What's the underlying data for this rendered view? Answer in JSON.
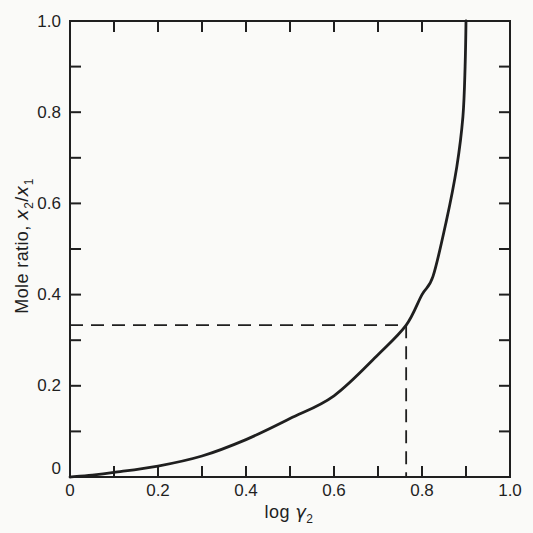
{
  "page": {
    "background": "#fafaf8",
    "ink": "#1f1f1f"
  },
  "axis_titles": {
    "y": {
      "prefix": "Mole ratio, ",
      "var1": "x",
      "sub1": "2",
      "slash": "/",
      "var2": "x",
      "sub2": "1"
    },
    "x": {
      "prefix": "log ",
      "symbol": "γ",
      "sub": "2"
    }
  },
  "chart_data": {
    "type": "line",
    "title": "",
    "xlabel": "log γ2",
    "ylabel": "Mole ratio, x2/x1",
    "xlim": [
      0,
      1.0
    ],
    "ylim": [
      0,
      1.0
    ],
    "grid": false,
    "legend": null,
    "frame": "box-with-inward-ticks-on-all-sides",
    "x_ticks": {
      "major": [
        0,
        0.2,
        0.4,
        0.6,
        0.8,
        1.0
      ],
      "labels": [
        "0",
        "0.2",
        "0.4",
        "0.6",
        "0.8",
        "1.0"
      ],
      "minor": [
        0.1,
        0.3,
        0.5,
        0.7,
        0.9
      ]
    },
    "y_ticks": {
      "major": [
        0,
        0.2,
        0.4,
        0.6,
        0.8,
        1.0
      ],
      "labels": [
        "0",
        "0.2",
        "0.4",
        "0.6",
        "0.8",
        "1.0"
      ],
      "minor": [
        0.1,
        0.3,
        0.5,
        0.7,
        0.9
      ]
    },
    "series": [
      {
        "name": "mole-ratio-vs-log-gamma2",
        "style": "solid",
        "points": [
          [
            0.0,
            0.0
          ],
          [
            0.05,
            0.004
          ],
          [
            0.1,
            0.01
          ],
          [
            0.2,
            0.024
          ],
          [
            0.3,
            0.046
          ],
          [
            0.4,
            0.082
          ],
          [
            0.5,
            0.128
          ],
          [
            0.6,
            0.178
          ],
          [
            0.7,
            0.268
          ],
          [
            0.764,
            0.333
          ],
          [
            0.8,
            0.4
          ],
          [
            0.825,
            0.44
          ],
          [
            0.855,
            0.56
          ],
          [
            0.879,
            0.68
          ],
          [
            0.893,
            0.79
          ],
          [
            0.898,
            0.9
          ],
          [
            0.9,
            1.0
          ]
        ]
      }
    ],
    "annotations": {
      "dashed_point": {
        "x": 0.764,
        "y": 0.333
      },
      "guides": "dashed horizontal line from y-axis to curve and dashed vertical line from curve down to x-axis"
    }
  }
}
